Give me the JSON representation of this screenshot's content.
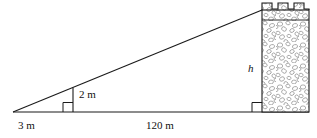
{
  "figure": {
    "labels": {
      "base_near": "3 m",
      "base_far": "120 m",
      "stick_height": "2 m",
      "tower_height": "h"
    },
    "icons": {
      "right_angle_stick": "right-angle-marker-icon",
      "right_angle_tower": "right-angle-marker-icon",
      "tower": "castle-tower-icon",
      "stone_fill": "stone-texture-icon"
    },
    "colors": {
      "line": "#1a1a1a",
      "text": "#111111",
      "stone_outline": "#8a8a8a",
      "background": "#ffffff"
    },
    "geometry": {
      "apex_x": 13,
      "apex_y": 112,
      "baseline_y": 112,
      "stick_x": 73,
      "stick_top_y": 88,
      "tower_left_x": 262,
      "tower_right_x": 309,
      "tower_top_y": 10,
      "crenel_top_y": 3,
      "merlon_count": 4
    }
  }
}
